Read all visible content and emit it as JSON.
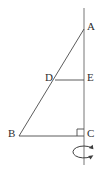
{
  "figure": {
    "background_color": "#ffffff",
    "stroke_color": "#4a4a4a",
    "axis_color": "#666666",
    "label_color": "#2e2e2e"
  },
  "labels": {
    "a": "A",
    "b": "B",
    "c": "C",
    "d": "D",
    "e": "E"
  },
  "points": {
    "a": {
      "x": 84,
      "y": 29
    },
    "b": {
      "x": 19,
      "y": 136
    },
    "c": {
      "x": 84,
      "y": 136
    },
    "d": {
      "x": 55,
      "y": 80
    },
    "e": {
      "x": 84,
      "y": 80
    }
  },
  "label_positions": {
    "a": {
      "x": 87,
      "y": 21
    },
    "b": {
      "x": 8,
      "y": 128
    },
    "c": {
      "x": 87,
      "y": 128
    },
    "d": {
      "x": 45,
      "y": 72
    },
    "e": {
      "x": 87,
      "y": 72
    }
  },
  "axis": {
    "name": "rotation-axis",
    "x": 84,
    "y_top": 8,
    "y_bottom": 165
  },
  "segments": [
    {
      "name": "segment-ab",
      "from": "a",
      "to": "b"
    },
    {
      "name": "segment-bc",
      "from": "b",
      "to": "c"
    },
    {
      "name": "segment-ac",
      "from": "a",
      "to": "c"
    },
    {
      "name": "segment-de",
      "from": "d",
      "to": "e"
    }
  ],
  "right_angle": {
    "name": "right-angle-mark-at-c",
    "vertex": "c",
    "size": 7
  },
  "rotation_indicator": {
    "name": "rotation-arrow",
    "center": {
      "x": 84,
      "y": 152
    },
    "rx": 11,
    "ry": 6,
    "direction": "counterclockwise"
  }
}
